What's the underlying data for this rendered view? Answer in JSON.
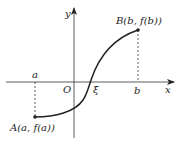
{
  "diagram": {
    "type": "function-graph",
    "axes": {
      "x_label": "x",
      "y_label": "y",
      "origin_label": "O"
    },
    "x_ticks": {
      "a": "a",
      "xi": "ξ",
      "b": "b"
    },
    "points": {
      "A": "A(a, f(a))",
      "B": "B(b, f(b))"
    },
    "colors": {
      "stroke": "#222222",
      "background": "#ffffff"
    }
  }
}
